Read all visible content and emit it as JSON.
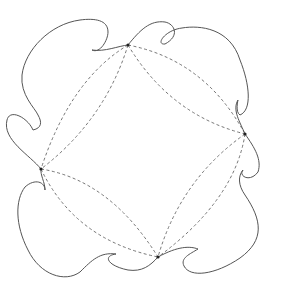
{
  "diagram": {
    "type": "escher-style tiling motif",
    "colors": {
      "background": "#ffffff",
      "outline": "#555555",
      "dashed": "#666666",
      "vertex": "#222222"
    },
    "vertices": [
      {
        "name": "top",
        "x": 128,
        "y": 45
      },
      {
        "name": "right",
        "x": 245,
        "y": 134
      },
      {
        "name": "bottom",
        "x": 158,
        "y": 257
      },
      {
        "name": "left",
        "x": 41,
        "y": 169
      }
    ],
    "outline_paths": [
      "M128,45 C118,46 105,52 92,50 C100,54 108,40 108,32 C108,20 95,18 80,20 C50,24 25,50 22,75 C20,95 35,108 38,115 C42,122 42,128 33,130 C28,118 10,108 7,120 C2,140 30,155 41,169",
      "M128,45 C140,30 150,20 165,22 C175,24 180,36 165,44 C155,45 165,30 182,28 C200,25 230,28 240,60 C250,85 252,110 240,115 C235,112 238,100 238,100 C232,110 240,122 245,134",
      "M245,134 C255,148 262,160 258,172 C250,183 238,176 243,170 C238,176 238,185 245,195 C262,220 265,240 240,258 C215,275 190,278 184,266 C180,258 190,254 198,249 C190,246 178,246 158,257",
      "M158,257 C150,266 142,272 128,270 C108,266 102,256 116,254 C100,252 92,260 80,272 C65,283 40,275 28,250 C15,225 15,200 25,187 C35,178 45,182 45,190 C45,182 40,175 41,169"
    ],
    "dashed_paths": [
      "M128,45 Q70,80 41,169",
      "M128,45 Q105,120 41,169",
      "M128,45 Q205,60 245,134",
      "M128,45 Q170,115 245,134",
      "M245,134 Q235,200 158,257",
      "M245,134 Q180,180 158,257",
      "M41,169 Q110,180 158,257",
      "M41,169 Q75,240 158,257"
    ]
  }
}
